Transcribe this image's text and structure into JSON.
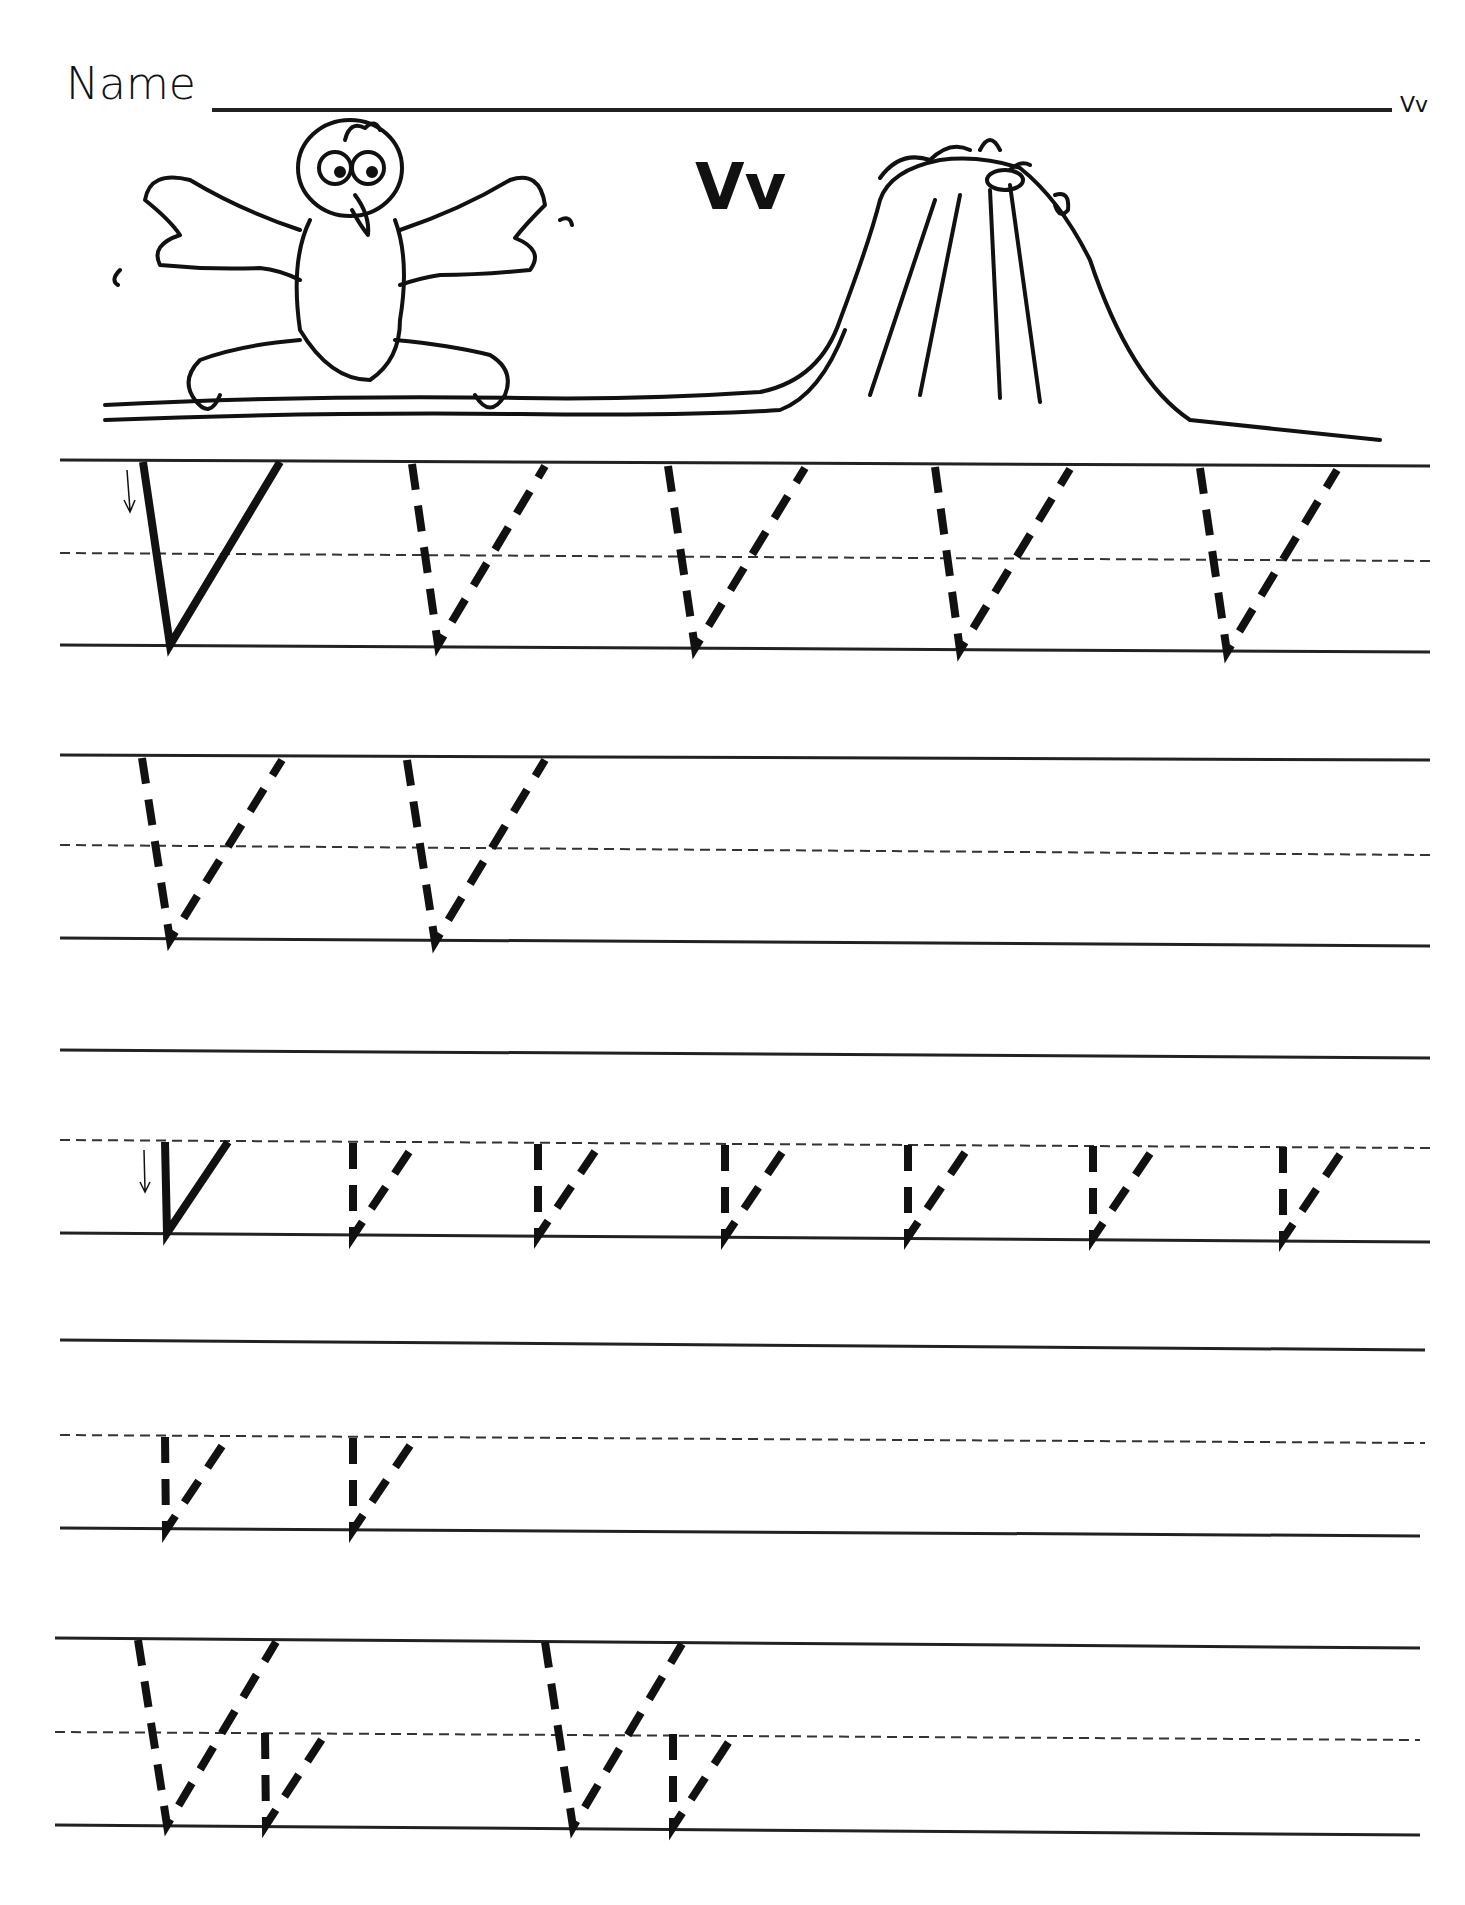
{
  "worksheet": {
    "name_label": "Name",
    "corner_tag": "Vv",
    "title": "Vv",
    "illustration": {
      "left": "vulture-cartoon",
      "right": "volcano-cartoon"
    },
    "rows": [
      {
        "type": "uppercase",
        "model_letter": "V",
        "traced_count": 4
      },
      {
        "type": "uppercase",
        "model_letter": null,
        "traced_count": 2
      },
      {
        "type": "lowercase",
        "model_letter": "v",
        "traced_count": 6
      },
      {
        "type": "lowercase",
        "model_letter": null,
        "traced_count": 2
      },
      {
        "type": "mixed",
        "pairs": [
          "Vv",
          "Vv"
        ]
      }
    ]
  }
}
